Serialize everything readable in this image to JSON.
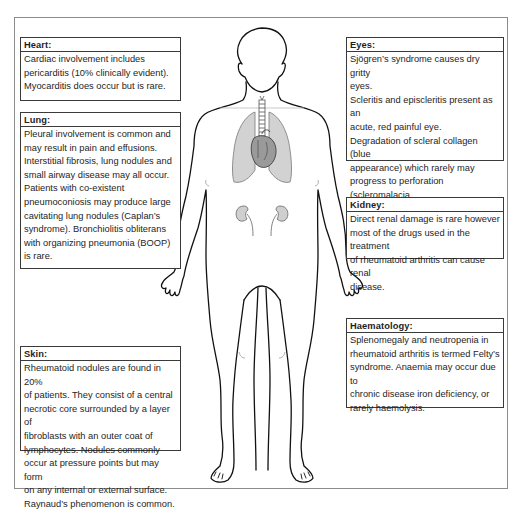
{
  "diagram": {
    "figure": {
      "icon": "human-body-outline",
      "organs_shown": [
        "lungs",
        "trachea",
        "heart",
        "kidneys"
      ],
      "organ_fill_color": "#c8c8c8",
      "outline_color": "#111111"
    },
    "boxes": {
      "heart": {
        "title": "Heart:",
        "lines": [
          "Cardiac involvement includes",
          "pericarditis (10% clinically evident).",
          "Myocarditis does occur but is rare."
        ]
      },
      "lung": {
        "title": "Lung:",
        "lines": [
          "Pleural involvement is common and",
          "may result in pain and effusions.",
          "Interstitial fibrosis, lung nodules and",
          "small airway disease may all occur.",
          "Patients with co-existent",
          "pneumoconiosis may produce large",
          "cavitating lung nodules (Caplan’s",
          "syndrome). Bronchiolitis obliterans",
          "with organizing pneumonia (BOOP)",
          "is rare."
        ]
      },
      "skin": {
        "title": "Skin:",
        "lines": [
          "Rheumatoid nodules are found in 20%",
          "of patients. They consist of a central",
          "necrotic core surrounded by a layer of",
          "fibroblasts with an outer coat of",
          "lymphocytes. Nodules commonly",
          "occur at pressure points but may form",
          "on any internal or external surface.",
          "Raynaud’s phenomenon is common."
        ]
      },
      "eyes": {
        "title": "Eyes:",
        "lines": [
          "Sjögren’s syndrome causes dry gritty",
          "eyes.",
          "Scleritis and episcleritis present as an",
          "acute, red painful eye.",
          "Degradation of scleral collagen (blue",
          "appearance) which rarely may",
          "progress to perforation (scleromalacia",
          "perforans)"
        ]
      },
      "kidney": {
        "title": "Kidney:",
        "lines": [
          "Direct renal damage is rare however",
          "most of the drugs used in the treatment",
          "of rheumatoid arthritis can cause renal",
          "disease."
        ]
      },
      "haematology": {
        "title": "Haematology:",
        "lines": [
          "Splenomegaly and neutropenia in",
          "rheumatoid arthritis is termed Felty’s",
          "syndrome. Anaemia may occur due to",
          "chronic disease iron deficiency, or",
          "rarely haemolysis."
        ]
      }
    }
  }
}
